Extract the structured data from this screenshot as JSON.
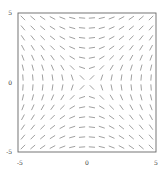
{
  "chart_data": {
    "type": "slope_field",
    "equation": "dy/dx = x/y",
    "title": "",
    "xlabel": "",
    "ylabel": "",
    "xlim": [
      -5,
      5
    ],
    "ylim": [
      -5,
      5
    ],
    "x_ticks": [
      -5,
      0,
      5
    ],
    "y_ticks": [
      -5,
      0,
      5
    ],
    "x_tick_labels": [
      "-5",
      "0",
      "5"
    ],
    "y_tick_labels": [
      "-5",
      "0",
      "5"
    ],
    "grid_n": 14,
    "grid": false,
    "legend": null,
    "segment_color": "#777777",
    "frame_color": "#666666"
  },
  "axes": {
    "x_ticks": [
      {
        "label": "-5",
        "value": -5
      },
      {
        "label": "0",
        "value": 0
      },
      {
        "label": "5",
        "value": 5
      }
    ],
    "y_ticks": [
      {
        "label": "5",
        "value": 5
      },
      {
        "label": "0",
        "value": 0
      },
      {
        "label": "-5",
        "value": -5
      }
    ]
  }
}
